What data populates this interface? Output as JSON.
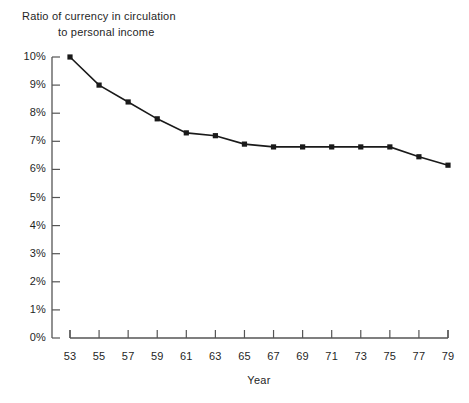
{
  "chart_data": {
    "type": "line",
    "title": "Ratio of currency in circulation to personal income",
    "title_line_1": "Ratio of currency in circulation",
    "title_line_2": "to personal income",
    "xlabel": "Year",
    "ylabel": "",
    "x": [
      53,
      55,
      57,
      59,
      61,
      63,
      65,
      67,
      69,
      71,
      73,
      75,
      77,
      79
    ],
    "values": [
      10.0,
      9.0,
      8.4,
      7.8,
      7.3,
      7.2,
      6.9,
      6.8,
      6.8,
      6.8,
      6.8,
      6.8,
      6.45,
      6.15
    ],
    "xtick_labels": [
      "53",
      "55",
      "57",
      "59",
      "61",
      "63",
      "65",
      "67",
      "69",
      "71",
      "73",
      "75",
      "77",
      "79"
    ],
    "ytick_labels": [
      "0%",
      "1%",
      "2%",
      "3%",
      "4%",
      "5%",
      "6%",
      "7%",
      "8%",
      "9%",
      "10%"
    ],
    "ytick_values": [
      0,
      1,
      2,
      3,
      4,
      5,
      6,
      7,
      8,
      9,
      10
    ],
    "xlim": [
      53,
      79
    ],
    "ylim": [
      0,
      10
    ],
    "grid": false,
    "legend": false,
    "marker": "filled-square",
    "line_color": "#1a1a1a",
    "marker_color": "#1a1a1a",
    "axis_color": "#555555",
    "background_color": "#ffffff"
  }
}
